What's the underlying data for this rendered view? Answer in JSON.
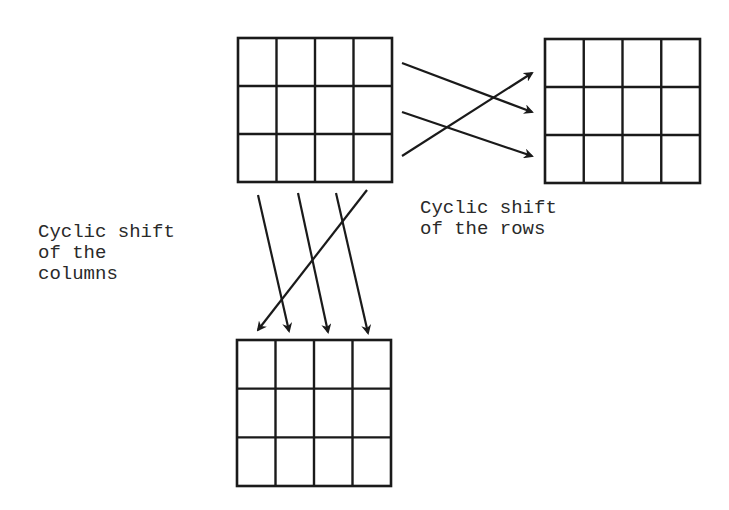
{
  "diagram": {
    "type": "matrix-cyclic-shift",
    "grids": [
      {
        "id": "source",
        "rows": 3,
        "cols": 4,
        "x": 238,
        "y": 38,
        "w": 154,
        "h": 144
      },
      {
        "id": "row-shifted",
        "rows": 3,
        "cols": 4,
        "x": 545,
        "y": 39,
        "w": 155,
        "h": 144
      },
      {
        "id": "column-shifted",
        "rows": 3,
        "cols": 4,
        "x": 237,
        "y": 340,
        "w": 154,
        "h": 146
      }
    ],
    "row_arrows": [
      {
        "from": [
          402,
          63
        ],
        "to": [
          532,
          112
        ]
      },
      {
        "from": [
          402,
          112
        ],
        "to": [
          532,
          156
        ]
      },
      {
        "from": [
          402,
          156
        ],
        "to": [
          532,
          73
        ]
      }
    ],
    "column_arrows": [
      {
        "from": [
          258,
          195
        ],
        "to": [
          289,
          331
        ]
      },
      {
        "from": [
          298,
          193
        ],
        "to": [
          328,
          332
        ]
      },
      {
        "from": [
          336,
          193
        ],
        "to": [
          368,
          333
        ]
      },
      {
        "from": [
          367,
          190
        ],
        "to": [
          258,
          330
        ]
      }
    ]
  },
  "labels": {
    "rows_label": "Cyclic shift\nof the rows",
    "columns_label": "Cyclic shift\nof the\ncolumns"
  },
  "colors": {
    "ink": "#1a1a1a",
    "background": "#ffffff"
  }
}
